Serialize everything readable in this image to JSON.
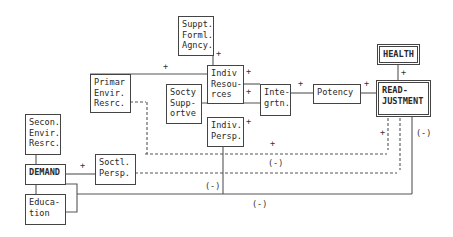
{
  "diagram": {
    "nodes": {
      "suppt_formal_agency": "Suppt.\nForml.\nAgncy.",
      "indiv_resources": "Indiv\nResou-\nrces",
      "primar_envir_resrc": "Primar\nEnvir.\nResrc.",
      "socty_supportve": "Socty\nSupp-\nortve",
      "integrtn": "Inte-\ngrtn.",
      "potency": "Potency",
      "health": "HEALTH",
      "readjustment": "READ-\nJUSTMENT",
      "indiv_persp": "Indiv.\nPersp.",
      "secon_envir_resrc": "Secon.\nEnvir.\nResrc.",
      "demand": "DEMAND",
      "soctl_persp": "Soctl.\nPersp.",
      "education": "Educa-\ntion"
    },
    "edge_labels": {
      "suppt_to_indiv": "+",
      "primar_to_indiv": "+",
      "indivres_to_integ_top": "+",
      "indivres_to_integ_bottom": "+",
      "indivpersp_plus": "+",
      "integ_to_potency": "+",
      "potency_to_readj": "+",
      "health_readj": "+",
      "demand_to_soctl": "+",
      "dashed_upper_plus": "+",
      "readj_dashed_plus": "+",
      "dashed_lower_neg": "(-)",
      "soctl_neg": "(-)",
      "bottom_neg": "(-)",
      "right_neg": "(-)"
    }
  }
}
